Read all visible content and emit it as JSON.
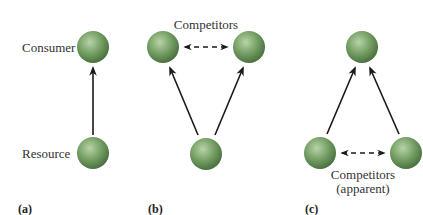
{
  "panels": [
    {
      "id": "a",
      "label": "(a)",
      "node_labels": {
        "top": "Consumer",
        "bottom": "Resource"
      }
    },
    {
      "id": "b",
      "label": "(b)",
      "competitors_label": "Competitors"
    },
    {
      "id": "c",
      "label": "(c)",
      "competitors_label_line1": "Competitors",
      "competitors_label_line2": "(apparent)"
    }
  ],
  "colors": {
    "node_fill": "#6f9a5e",
    "node_highlight": "#b9d3a9",
    "node_shadow": "#4c7240",
    "arrow": "#1a1a1a"
  }
}
